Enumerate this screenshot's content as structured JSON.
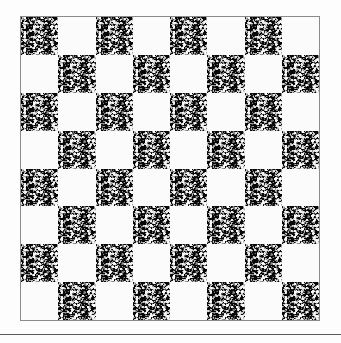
{
  "figure": {
    "name": "checkerboard-figure",
    "kind": "checkerboard",
    "rows": 8,
    "columns": 8,
    "square_count": 64,
    "dark_square_count": 32,
    "light_square_count": 32,
    "top_left_square_color": "dark",
    "colors": {
      "page_background": "#fdfdfd",
      "dark_square": "#070707",
      "dark_square_speckle": "#ffffff",
      "light_square": "#fbfbfb",
      "board_border": "#8a8a8a",
      "rule": "#5b5b5b"
    },
    "geometry": {
      "board_left": 20,
      "board_top": 16,
      "board_width": 300,
      "board_height": 305,
      "cell_width": 37.5,
      "cell_height": 38.0,
      "rule_y": 334
    },
    "pattern": [
      [
        "dark",
        "light",
        "dark",
        "light",
        "dark",
        "light",
        "dark",
        "light"
      ],
      [
        "light",
        "dark",
        "light",
        "dark",
        "light",
        "dark",
        "light",
        "dark"
      ],
      [
        "dark",
        "light",
        "dark",
        "light",
        "dark",
        "light",
        "dark",
        "light"
      ],
      [
        "light",
        "dark",
        "light",
        "dark",
        "light",
        "dark",
        "light",
        "dark"
      ],
      [
        "dark",
        "light",
        "dark",
        "light",
        "dark",
        "light",
        "dark",
        "light"
      ],
      [
        "light",
        "dark",
        "light",
        "dark",
        "light",
        "dark",
        "light",
        "dark"
      ],
      [
        "dark",
        "light",
        "dark",
        "light",
        "dark",
        "light",
        "dark",
        "light"
      ],
      [
        "light",
        "dark",
        "light",
        "dark",
        "light",
        "dark",
        "light",
        "dark"
      ]
    ]
  },
  "rule": {
    "label": ""
  }
}
